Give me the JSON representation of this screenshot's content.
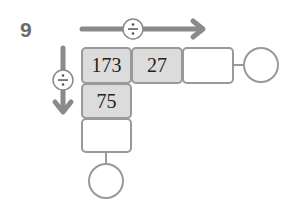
{
  "problem_number": "9",
  "operator_symbol": "÷",
  "grid": {
    "row": [
      "173",
      "27",
      "",
      ""
    ],
    "column": [
      "173",
      "75",
      "",
      ""
    ]
  },
  "colors": {
    "arrow": "#8a8a8a",
    "border": "#999999",
    "fill": "#dcdcdc"
  }
}
